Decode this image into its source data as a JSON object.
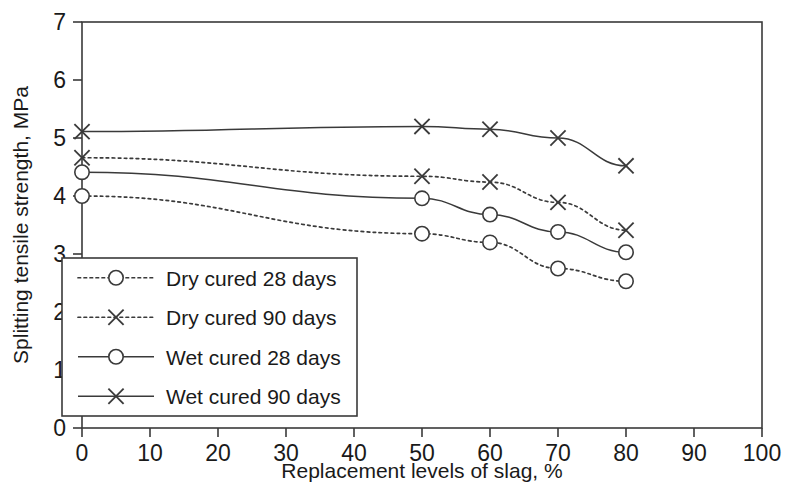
{
  "chart_data": {
    "type": "line",
    "title": "",
    "xlabel": "Replacement levels of slag, %",
    "ylabel": "Splitting tensile strength, MPa",
    "xlim": [
      0,
      100
    ],
    "ylim": [
      0,
      7
    ],
    "xticks": [
      0,
      10,
      20,
      30,
      40,
      50,
      60,
      70,
      80,
      90,
      100
    ],
    "yticks": [
      0,
      1,
      2,
      3,
      4,
      5,
      6,
      7
    ],
    "xtick_labels": [
      "0",
      "10",
      "20",
      "30",
      "40",
      "50",
      "60",
      "70",
      "80",
      "90",
      "100"
    ],
    "ytick_labels": [
      "0",
      "1",
      "2",
      "3",
      "4",
      "5",
      "6",
      "7"
    ],
    "grid": false,
    "legend_position": "lower-left-inside",
    "x": [
      0,
      50,
      60,
      70,
      80
    ],
    "series": [
      {
        "name": "Dry cured 28 days",
        "values": [
          4.0,
          3.35,
          3.2,
          2.75,
          2.53
        ],
        "line_style": "dotted",
        "marker": "circle"
      },
      {
        "name": "Dry cured 90 days",
        "values": [
          4.66,
          4.34,
          4.24,
          3.89,
          3.41
        ],
        "line_style": "dotted",
        "marker": "cross"
      },
      {
        "name": "Wet cured 28 days",
        "values": [
          4.41,
          3.96,
          3.68,
          3.38,
          3.03
        ],
        "line_style": "solid",
        "marker": "circle"
      },
      {
        "name": "Wet cured 90 days",
        "values": [
          5.11,
          5.2,
          5.15,
          5.0,
          4.52
        ],
        "line_style": "solid",
        "marker": "cross"
      }
    ],
    "colors": {
      "line": "#3a3a3a",
      "marker_fill": "#ffffff",
      "axis": "#3a3a3a",
      "background": "#ffffff",
      "text": "#1a1a1a"
    }
  }
}
